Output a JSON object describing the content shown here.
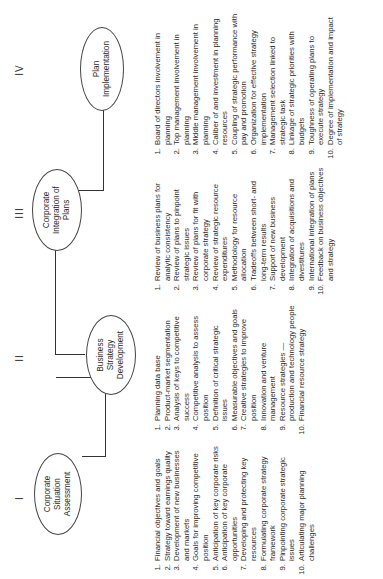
{
  "diagram": {
    "stages": [
      {
        "numeral": "I",
        "title_lines": [
          "Corporate",
          "Situation",
          "Assessment"
        ],
        "items": [
          {
            "n": "1.",
            "text": "Financial objectives and goals"
          },
          {
            "n": "2.",
            "text": "Strategy toward earnings quality"
          },
          {
            "n": "3.",
            "text": "Development of new businesses and markets"
          },
          {
            "n": "4.",
            "text": "Goals for improving competitive position"
          },
          {
            "n": "5.",
            "text": "Anticipation of key corporate risks"
          },
          {
            "n": "6.",
            "text": "Anticipation of key corporate opportunities"
          },
          {
            "n": "7.",
            "text": "Developing and protecting key resources"
          },
          {
            "n": "8.",
            "text": "Formulating corporate strategy framework"
          },
          {
            "n": "9.",
            "text": "Pinpointing corporate strategic issues"
          },
          {
            "n": "10.",
            "text": "Articulating major planning challenges"
          }
        ]
      },
      {
        "numeral": "II",
        "title_lines": [
          "Business",
          "Strategy",
          "Development"
        ],
        "items": [
          {
            "n": "1.",
            "text": "Planning data base"
          },
          {
            "n": "2.",
            "text": "Product-market segmentation"
          },
          {
            "n": "3.",
            "text": "Analysis of keys to competitive success"
          },
          {
            "n": "4.",
            "text": "Competitive analysis to assess position"
          },
          {
            "n": "5.",
            "text": "Definition of critical strategic issues"
          },
          {
            "n": "6.",
            "text": "Measurable objectives and goals"
          },
          {
            "n": "7.",
            "text": "Creative strategies to improve position"
          },
          {
            "n": "8.",
            "text": "Innovation and venture management"
          },
          {
            "n": "9.",
            "text": "Resource strategies — production and technology people"
          },
          {
            "n": "10.",
            "text": "Financial resource strategy"
          }
        ]
      },
      {
        "numeral": "III",
        "title_lines": [
          "Corporate",
          "Integration of",
          "Plans"
        ],
        "items": [
          {
            "n": "1.",
            "text": "Review of business plans for analytic consistency"
          },
          {
            "n": "2.",
            "text": "Review of plans to pinpoint strategic issues"
          },
          {
            "n": "3.",
            "text": "Review of plans for fit with corporate strategy"
          },
          {
            "n": "4.",
            "text": "Review of strategic resource expenditures"
          },
          {
            "n": "5.",
            "text": "Methodology for resource allocation"
          },
          {
            "n": "6.",
            "text": "Tradeoffs between short- and long-term results"
          },
          {
            "n": "7.",
            "text": "Support of new business development"
          },
          {
            "n": "8.",
            "text": "Integration of acquisitions and divestitures"
          },
          {
            "n": "9.",
            "text": "International integration of plans"
          },
          {
            "n": "10.",
            "text": "Feedback on business objectives and strategy"
          }
        ]
      },
      {
        "numeral": "IV",
        "title_lines": [
          "Plan",
          "Implementation"
        ],
        "items": [
          {
            "n": "1.",
            "text": "Board of directors involvement in planning"
          },
          {
            "n": "2.",
            "text": "Top management involvement in planning"
          },
          {
            "n": "3.",
            "text": "Middle management involvement in planning"
          },
          {
            "n": "4.",
            "text": "Caliber of and investment in planning resources"
          },
          {
            "n": "5.",
            "text": "Coupling of strategic performance with pay and promotion"
          },
          {
            "n": "6.",
            "text": "Organization for effective strategy implementation"
          },
          {
            "n": "7.",
            "text": "Management selection linked to strategic task"
          },
          {
            "n": "8.",
            "text": "Linkage of strategic priorities with budgets"
          },
          {
            "n": "9.",
            "text": "Toughness of operating plans to execute strategy"
          },
          {
            "n": "10.",
            "text": "Degree of implementation and impact of strategy"
          }
        ]
      }
    ]
  }
}
